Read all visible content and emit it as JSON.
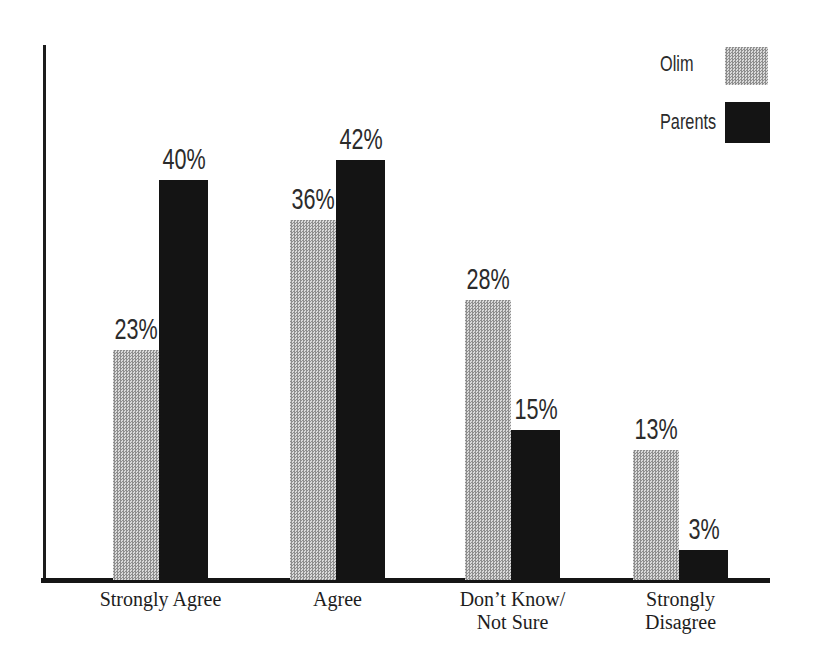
{
  "chart_data": {
    "type": "bar",
    "title": "",
    "xlabel": "",
    "ylabel": "",
    "ylim": [
      0,
      50
    ],
    "grid": false,
    "legend_position": "top-right",
    "categories": [
      "Strongly Agree",
      "Agree",
      "Don’t Know/ Not Sure",
      "Strongly Disagree"
    ],
    "category_lines": [
      [
        "Strongly Agree"
      ],
      [
        "Agree"
      ],
      [
        "Don’t Know/",
        "Not Sure"
      ],
      [
        "Strongly",
        "Disagree"
      ]
    ],
    "series": [
      {
        "name": "Olim",
        "style": "halftone-gray",
        "color": "#b5b5b5",
        "values": [
          23,
          36,
          28,
          13
        ],
        "labels": [
          "23%",
          "36%",
          "28%",
          "13%"
        ]
      },
      {
        "name": "Parents",
        "style": "solid-black",
        "color": "#141414",
        "values": [
          40,
          42,
          15,
          3
        ],
        "labels": [
          "40%",
          "42%",
          "15%",
          "3%"
        ]
      }
    ]
  },
  "legend": {
    "items": [
      {
        "label": "Olim",
        "swatch": "halftone-gray"
      },
      {
        "label": "Parents",
        "swatch": "solid-black"
      }
    ]
  },
  "colors": {
    "axis": "#1c1c1c",
    "bar_black": "#141414",
    "bar_gray_avg": "#b5b5b5",
    "text": "#2b2b2b",
    "background": "#ffffff"
  }
}
